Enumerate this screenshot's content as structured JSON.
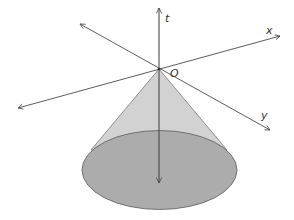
{
  "diagram": {
    "labels": {
      "t_axis": "t",
      "x_axis": "x",
      "y_axis": "y",
      "origin": "O"
    },
    "colors": {
      "axis": "#4a4a4a",
      "cone_side": "#cfcfcf",
      "cone_base": "#aaaaaa",
      "outline": "#666666"
    }
  }
}
